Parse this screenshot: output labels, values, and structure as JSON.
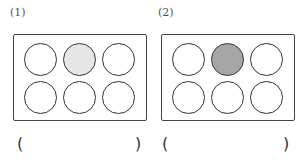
{
  "problems": [
    {
      "label": "(1)",
      "circles": [
        {
          "row": 1,
          "col": 1,
          "fill": "#ffffff"
        },
        {
          "row": 1,
          "col": 2,
          "fill": "#e6e6e6"
        },
        {
          "row": 1,
          "col": 3,
          "fill": "#ffffff"
        },
        {
          "row": 2,
          "col": 1,
          "fill": "#ffffff"
        },
        {
          "row": 2,
          "col": 2,
          "fill": "#ffffff"
        },
        {
          "row": 2,
          "col": 3,
          "fill": "#ffffff"
        }
      ],
      "answer_open": "(",
      "answer_close": ")",
      "answer_value": ""
    },
    {
      "label": "(2)",
      "circles": [
        {
          "row": 1,
          "col": 1,
          "fill": "#ffffff"
        },
        {
          "row": 1,
          "col": 2,
          "fill": "#a6a6a6"
        },
        {
          "row": 1,
          "col": 3,
          "fill": "#ffffff"
        },
        {
          "row": 2,
          "col": 1,
          "fill": "#ffffff"
        },
        {
          "row": 2,
          "col": 2,
          "fill": "#ffffff"
        },
        {
          "row": 2,
          "col": 3,
          "fill": "#ffffff"
        }
      ],
      "answer_open": "(",
      "answer_close": ")",
      "answer_value": ""
    }
  ]
}
